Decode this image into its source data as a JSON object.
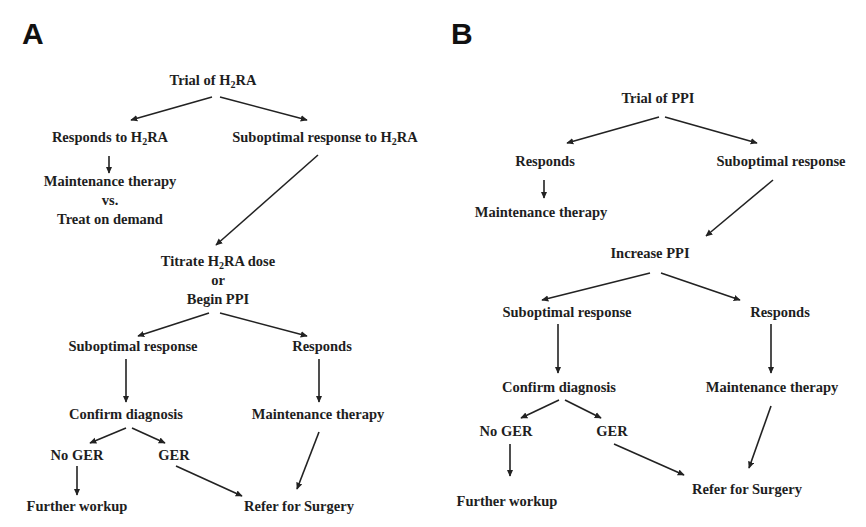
{
  "panels": {
    "a": {
      "label": "A",
      "nodes": {
        "trial": {
          "pre": "Trial of H",
          "sub": "2",
          "post": "RA"
        },
        "responds": {
          "pre": "Responds to H",
          "sub": "2",
          "post": "RA"
        },
        "suboptimal": {
          "pre": "Suboptimal response to H",
          "sub": "2",
          "post": "RA"
        },
        "maintenance_vs": {
          "line1": "Maintenance therapy",
          "line2": "vs.",
          "line3": "Treat on demand"
        },
        "titrate": {
          "line1_pre": "Titrate H",
          "line1_sub": "2",
          "line1_post": "RA dose",
          "line2": "or",
          "line3": "Begin PPI"
        },
        "suboptimal2": "Suboptimal response",
        "responds2": "Responds",
        "confirm": "Confirm diagnosis",
        "maintenance2": "Maintenance therapy",
        "no_ger": "No GER",
        "ger": "GER",
        "further": "Further workup",
        "refer": "Refer for Surgery"
      }
    },
    "b": {
      "label": "B",
      "nodes": {
        "trial": "Trial of PPI",
        "responds": "Responds",
        "suboptimal": "Suboptimal response",
        "maintenance": "Maintenance therapy",
        "increase": "Increase PPI",
        "suboptimal2": "Suboptimal response",
        "responds2": "Responds",
        "confirm": "Confirm diagnosis",
        "maintenance2": "Maintenance therapy",
        "no_ger": "No GER",
        "ger": "GER",
        "further": "Further workup",
        "refer": "Refer for Surgery"
      }
    }
  },
  "style": {
    "text_color": "#1e1e1e",
    "arrow_color": "#222222",
    "background": "#ffffff"
  },
  "edges": {
    "a": [
      [
        "Trial of H2RA",
        "Responds to H2RA"
      ],
      [
        "Trial of H2RA",
        "Suboptimal response to H2RA"
      ],
      [
        "Responds to H2RA",
        "Maintenance therapy vs. Treat on demand"
      ],
      [
        "Suboptimal response to H2RA",
        "Titrate H2RA dose or Begin PPI"
      ],
      [
        "Titrate H2RA dose or Begin PPI",
        "Suboptimal response"
      ],
      [
        "Titrate H2RA dose or Begin PPI",
        "Responds"
      ],
      [
        "Suboptimal response",
        "Confirm diagnosis"
      ],
      [
        "Responds",
        "Maintenance therapy"
      ],
      [
        "Confirm diagnosis",
        "No GER"
      ],
      [
        "Confirm diagnosis",
        "GER"
      ],
      [
        "No GER",
        "Further workup"
      ],
      [
        "GER",
        "Refer for Surgery"
      ],
      [
        "Maintenance therapy",
        "Refer for Surgery"
      ]
    ],
    "b": [
      [
        "Trial of PPI",
        "Responds"
      ],
      [
        "Trial of PPI",
        "Suboptimal response"
      ],
      [
        "Responds",
        "Maintenance therapy"
      ],
      [
        "Suboptimal response",
        "Increase PPI"
      ],
      [
        "Increase PPI",
        "Suboptimal response"
      ],
      [
        "Increase PPI",
        "Responds"
      ],
      [
        "Suboptimal response",
        "Confirm diagnosis"
      ],
      [
        "Responds",
        "Maintenance therapy"
      ],
      [
        "Confirm diagnosis",
        "No GER"
      ],
      [
        "Confirm diagnosis",
        "GER"
      ],
      [
        "No GER",
        "Further workup"
      ],
      [
        "GER",
        "Refer for Surgery"
      ],
      [
        "Maintenance therapy",
        "Refer for Surgery"
      ]
    ]
  }
}
